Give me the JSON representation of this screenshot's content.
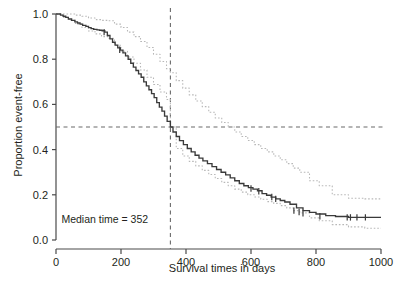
{
  "chart_data": {
    "type": "line",
    "title": "",
    "xlabel": "Survival times in days",
    "ylabel": "Proportion event-free",
    "xlim": [
      0,
      1000
    ],
    "ylim": [
      0.0,
      1.0
    ],
    "xticks": [
      0,
      200,
      400,
      600,
      800,
      1000
    ],
    "xtick_labels": [
      "0",
      "200",
      "400",
      "600",
      "800",
      "1000"
    ],
    "yticks": [
      0.0,
      0.2,
      0.4,
      0.6,
      0.8,
      1.0
    ],
    "ytick_labels": [
      "0.0",
      "0.2",
      "0.4",
      "0.6",
      "0.8",
      "1.0"
    ],
    "grid": false,
    "legend": "none",
    "annotations": [
      {
        "name": "median-time-label",
        "text": "Median time = 352",
        "x": 150,
        "y": 0.075
      }
    ],
    "reference_lines": [
      {
        "name": "median-vline",
        "orientation": "vertical",
        "value": 352,
        "style": "dashed",
        "color": "#6b6b6b"
      },
      {
        "name": "half-hline",
        "orientation": "horizontal",
        "value": 0.5,
        "style": "dashed",
        "color": "#6b6b6b"
      }
    ],
    "series": [
      {
        "name": "Kaplan-Meier estimate",
        "role": "estimate",
        "style": "step-solid",
        "color": "#3a3a3a",
        "x": [
          0,
          14,
          22,
          30,
          38,
          48,
          58,
          66,
          74,
          82,
          92,
          100,
          108,
          116,
          126,
          134,
          142,
          150,
          158,
          166,
          174,
          182,
          190,
          198,
          206,
          214,
          222,
          230,
          238,
          246,
          254,
          262,
          270,
          278,
          286,
          294,
          302,
          310,
          318,
          326,
          334,
          342,
          352,
          360,
          370,
          380,
          392,
          404,
          416,
          428,
          440,
          452,
          466,
          480,
          494,
          508,
          522,
          536,
          550,
          564,
          578,
          592,
          606,
          620,
          634,
          648,
          662,
          676,
          690,
          704,
          720,
          740,
          760,
          780,
          800,
          830,
          860,
          900,
          950,
          1000
        ],
        "y": [
          1.0,
          0.995,
          0.99,
          0.985,
          0.978,
          0.972,
          0.965,
          0.96,
          0.955,
          0.95,
          0.945,
          0.94,
          0.935,
          0.932,
          0.93,
          0.928,
          0.926,
          0.92,
          0.905,
          0.89,
          0.875,
          0.862,
          0.85,
          0.84,
          0.828,
          0.815,
          0.8,
          0.782,
          0.765,
          0.75,
          0.735,
          0.72,
          0.7,
          0.682,
          0.665,
          0.648,
          0.63,
          0.608,
          0.588,
          0.57,
          0.548,
          0.525,
          0.5,
          0.478,
          0.458,
          0.44,
          0.422,
          0.405,
          0.39,
          0.375,
          0.362,
          0.35,
          0.338,
          0.325,
          0.312,
          0.3,
          0.288,
          0.275,
          0.262,
          0.25,
          0.24,
          0.232,
          0.225,
          0.218,
          0.205,
          0.198,
          0.19,
          0.182,
          0.175,
          0.168,
          0.158,
          0.142,
          0.13,
          0.122,
          0.115,
          0.108,
          0.104,
          0.1,
          0.1,
          0.1
        ]
      },
      {
        "name": "Upper 95% confidence limit",
        "role": "ci-upper",
        "style": "step-dotted",
        "color": "#b8b8b8",
        "x": [
          0,
          20,
          40,
          60,
          80,
          100,
          120,
          140,
          160,
          180,
          200,
          220,
          240,
          260,
          280,
          300,
          320,
          340,
          352,
          370,
          390,
          410,
          430,
          450,
          470,
          490,
          510,
          530,
          550,
          570,
          590,
          610,
          630,
          650,
          670,
          690,
          710,
          730,
          750,
          780,
          810,
          850,
          900,
          950,
          1000
        ],
        "y": [
          1.0,
          1.0,
          1.0,
          0.995,
          0.99,
          0.982,
          0.975,
          0.972,
          0.97,
          0.955,
          0.94,
          0.92,
          0.9,
          0.878,
          0.852,
          0.822,
          0.79,
          0.758,
          0.74,
          0.705,
          0.672,
          0.642,
          0.615,
          0.59,
          0.565,
          0.54,
          0.52,
          0.5,
          0.478,
          0.458,
          0.44,
          0.422,
          0.405,
          0.39,
          0.372,
          0.355,
          0.338,
          0.318,
          0.3,
          0.262,
          0.24,
          0.2,
          0.185,
          0.182,
          0.182
        ]
      },
      {
        "name": "Lower 95% confidence limit",
        "role": "ci-lower",
        "style": "step-dotted",
        "color": "#b8b8b8",
        "x": [
          0,
          20,
          40,
          60,
          80,
          100,
          120,
          140,
          160,
          180,
          200,
          220,
          240,
          260,
          280,
          300,
          320,
          340,
          352,
          370,
          390,
          410,
          430,
          450,
          470,
          490,
          510,
          530,
          550,
          570,
          590,
          610,
          630,
          650,
          670,
          690,
          710,
          730,
          750,
          780,
          810,
          850,
          900,
          950,
          1000
        ],
        "y": [
          1.0,
          0.985,
          0.972,
          0.955,
          0.94,
          0.925,
          0.912,
          0.9,
          0.892,
          0.862,
          0.835,
          0.81,
          0.782,
          0.752,
          0.72,
          0.688,
          0.655,
          0.622,
          0.5,
          0.405,
          0.372,
          0.348,
          0.328,
          0.308,
          0.29,
          0.272,
          0.255,
          0.24,
          0.225,
          0.212,
          0.2,
          0.19,
          0.18,
          0.17,
          0.162,
          0.152,
          0.142,
          0.13,
          0.12,
          0.098,
          0.085,
          0.068,
          0.058,
          0.052,
          0.052
        ]
      }
    ],
    "censor_marks": {
      "name": "censoring-ticks",
      "style": "plus-tick",
      "color": "#3a3a3a",
      "points": [
        {
          "x": 148,
          "y": 0.92
        },
        {
          "x": 196,
          "y": 0.842
        },
        {
          "x": 600,
          "y": 0.228
        },
        {
          "x": 624,
          "y": 0.216
        },
        {
          "x": 664,
          "y": 0.19
        },
        {
          "x": 676,
          "y": 0.182
        },
        {
          "x": 732,
          "y": 0.13
        },
        {
          "x": 748,
          "y": 0.124
        },
        {
          "x": 760,
          "y": 0.118
        },
        {
          "x": 812,
          "y": 0.105
        },
        {
          "x": 896,
          "y": 0.1
        },
        {
          "x": 906,
          "y": 0.1
        },
        {
          "x": 926,
          "y": 0.1
        },
        {
          "x": 952,
          "y": 0.1
        }
      ]
    }
  },
  "axes": {
    "x_axis_name": "survival-time-axis",
    "y_axis_name": "proportion-event-free-axis"
  }
}
